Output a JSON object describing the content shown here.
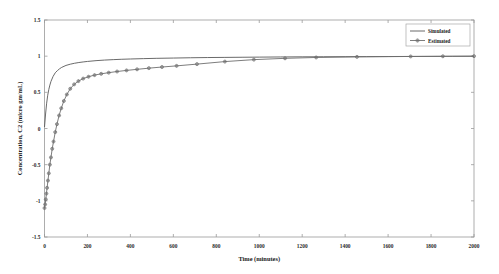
{
  "chart_data": {
    "type": "line",
    "title": "",
    "xlabel": "Time (minutes)",
    "ylabel": "Concentration, C2 (micro gm/mL)",
    "xlim": [
      0,
      2000
    ],
    "ylim": [
      -1.5,
      1.5
    ],
    "xticks": [
      0,
      200,
      400,
      600,
      800,
      1000,
      1200,
      1400,
      1600,
      1800,
      2000
    ],
    "xticklabels": [
      "0",
      "200",
      "400",
      "600",
      "800",
      "1000",
      "1200",
      "1400",
      "1600",
      "1800",
      "2000"
    ],
    "yticks": [
      -1.5,
      -1,
      -0.5,
      0,
      0.5,
      1,
      1.5
    ],
    "yticklabels": [
      "-1.5",
      "-1",
      "-0.5",
      "0",
      "0.5",
      "1",
      "1.5"
    ],
    "grid": false,
    "legend_position": "top-right",
    "series": [
      {
        "name": "Simulated",
        "color": "#595959",
        "marker": "none",
        "x": [
          0,
          5,
          10,
          15,
          20,
          25,
          30,
          40,
          50,
          60,
          70,
          80,
          100,
          120,
          140,
          160,
          180,
          200,
          240,
          280,
          320,
          360,
          400,
          460,
          520,
          600,
          680,
          760,
          840,
          920,
          1000,
          1100,
          1200,
          1300,
          1400,
          1500,
          1600,
          1700,
          1800,
          1900,
          2000
        ],
        "y": [
          0.02,
          0.2,
          0.35,
          0.46,
          0.54,
          0.6,
          0.65,
          0.72,
          0.77,
          0.8,
          0.825,
          0.845,
          0.872,
          0.889,
          0.902,
          0.912,
          0.92,
          0.927,
          0.938,
          0.946,
          0.952,
          0.957,
          0.961,
          0.966,
          0.97,
          0.974,
          0.978,
          0.981,
          0.983,
          0.985,
          0.987,
          0.989,
          0.991,
          0.992,
          0.993,
          0.994,
          0.995,
          0.996,
          0.997,
          0.998,
          0.999
        ]
      },
      {
        "name": "Estimated",
        "color": "#6e6e6e",
        "marker": "circle-plus",
        "x": [
          0,
          3,
          6,
          9,
          12,
          16,
          20,
          25,
          30,
          36,
          42,
          50,
          58,
          68,
          78,
          90,
          104,
          120,
          138,
          158,
          180,
          205,
          233,
          264,
          299,
          338,
          382,
          431,
          486,
          547,
          615,
          710,
          840,
          975,
          1120,
          1265,
          1455,
          1705,
          1855,
          2000
        ],
        "y": [
          -1.1,
          -1.05,
          -0.98,
          -0.9,
          -0.82,
          -0.72,
          -0.62,
          -0.5,
          -0.4,
          -0.28,
          -0.18,
          -0.05,
          0.06,
          0.18,
          0.28,
          0.38,
          0.47,
          0.55,
          0.61,
          0.655,
          0.69,
          0.716,
          0.738,
          0.756,
          0.772,
          0.788,
          0.803,
          0.818,
          0.834,
          0.85,
          0.866,
          0.89,
          0.925,
          0.952,
          0.97,
          0.982,
          0.99,
          0.996,
          0.998,
          1.0
        ]
      }
    ]
  },
  "legend": {
    "items": [
      {
        "label": "Simulated"
      },
      {
        "label": "Estimated"
      }
    ]
  }
}
